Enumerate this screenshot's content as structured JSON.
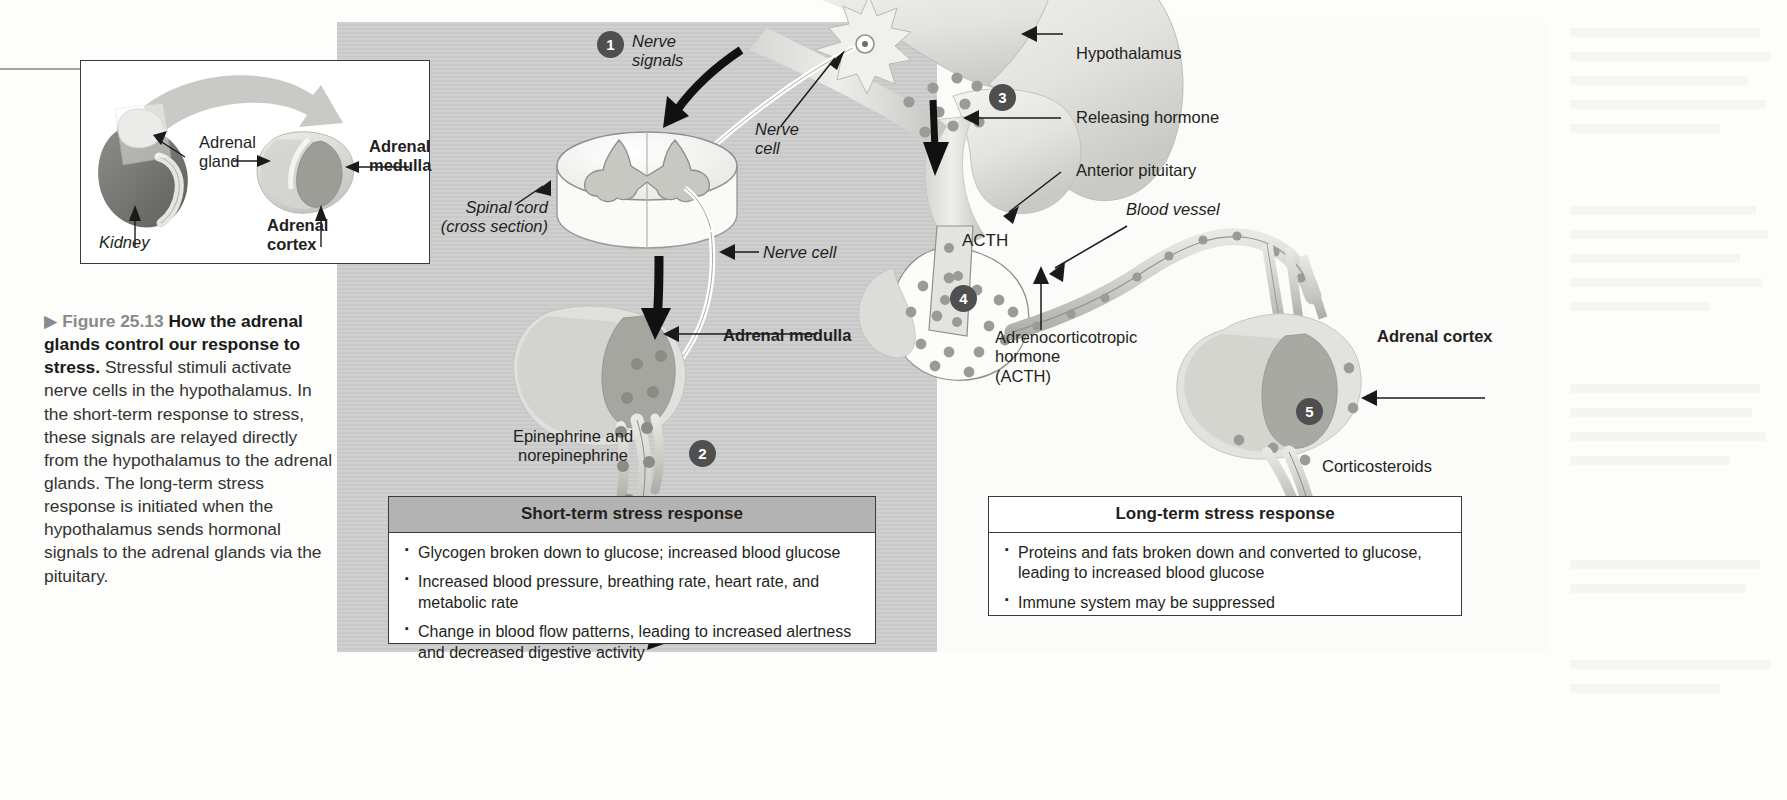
{
  "figure": {
    "marker": "▶",
    "tag": "Figure 25.13",
    "title": "How the adrenal glands control our response to stress.",
    "body": "Stressful stimuli activate nerve cells in the hypothalamus. In the short-term response to stress, these signals are relayed directly from the hypothalamus to the adrenal glands. The long-term stress response is initiated when the hypothalamus sends hormonal signals to the adrenal glands via the pituitary."
  },
  "inset": {
    "kidney_label": "Kidney",
    "adrenal_gland_label": "Adrenal\ngland",
    "adrenal_medulla_label": "Adrenal\nmedulla",
    "adrenal_cortex_label": "Adrenal\ncortex"
  },
  "left_panel": {
    "step1": "1",
    "step2": "2",
    "nerve_signals": "Nerve\nsignals",
    "nerve_cell_upper": "Nerve\ncell",
    "nerve_cell_lower": "Nerve cell",
    "spinal_cord": "Spinal cord\n(cross section)",
    "adrenal_medulla": "Adrenal medulla",
    "epinephrine": "Epinephrine and\nnorepinephrine"
  },
  "right_panel": {
    "step3": "3",
    "step4": "4",
    "step5": "5",
    "hypothalamus": "Hypothalamus",
    "releasing_hormone": "Releasing hormone",
    "anterior_pituitary": "Anterior pituitary",
    "blood_vessel": "Blood vessel",
    "acth_inline": "ACTH",
    "acth_full": "Adrenocorticotropic\nhormone\n(ACTH)",
    "adrenal_cortex": "Adrenal cortex",
    "corticosteroids": "Corticosteroids"
  },
  "short_term_box": {
    "heading": "Short-term stress response",
    "bullets": [
      "Glycogen broken down to glucose; increased blood glucose",
      "Increased blood pressure, breathing rate, heart rate, and metabolic rate",
      "Change in blood flow patterns, leading to increased alertness and decreased digestive activity"
    ]
  },
  "long_term_box": {
    "heading": "Long-term stress response",
    "bullets": [
      "Proteins and fats broken down and converted to glucose, leading to increased blood glucose",
      "Immune system may be suppressed"
    ]
  },
  "colors": {
    "panel_gray": "#cdcdcd",
    "step_circle": "#4f4f4f",
    "box_header_gray": "#b3b3b3",
    "text": "#231f20",
    "kidney_dark": "#6e6e6e",
    "gland_light": "#e2e2e2",
    "medulla_mid": "#a0a0a0"
  }
}
